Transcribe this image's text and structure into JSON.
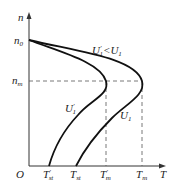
{
  "diagram": {
    "axes": {
      "y_label": "n",
      "x_label": "T",
      "origin_label": "O"
    },
    "y_ticks": [
      {
        "base": "n",
        "sub": "0",
        "prime": ""
      },
      {
        "base": "n",
        "sub": "m",
        "prime": ""
      }
    ],
    "x_ticks": [
      {
        "base": "T",
        "sub": "st",
        "prime": "'"
      },
      {
        "base": "T",
        "sub": "st",
        "prime": ""
      },
      {
        "base": "T",
        "sub": "m",
        "prime": "'"
      },
      {
        "base": "T",
        "sub": "m",
        "prime": ""
      }
    ],
    "curves": [
      {
        "name": "U1'",
        "base": "U",
        "sub": "1",
        "prime": "'"
      },
      {
        "name": "U1",
        "base": "U",
        "sub": "1",
        "prime": ""
      }
    ],
    "annotation": {
      "left": "U",
      "left_sub": "1",
      "left_prime": "'",
      "op": "<",
      "right": "U",
      "right_sub": "1"
    }
  }
}
